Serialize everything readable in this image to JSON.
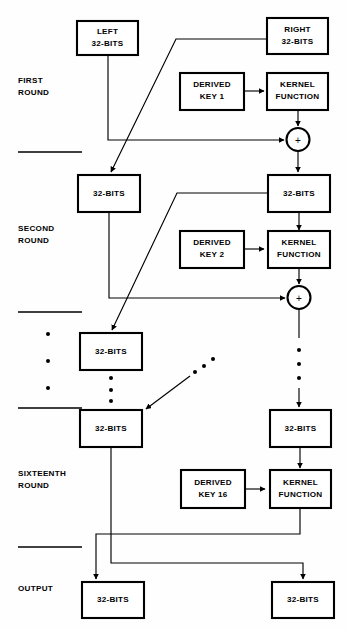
{
  "figure": {
    "colors": {
      "stroke": "#000000",
      "box_fill": "#ffffff",
      "background": "#ffffff"
    }
  },
  "round_labels": {
    "first": {
      "line1": "FIRST",
      "line2": "ROUND"
    },
    "second": {
      "line1": "SECOND",
      "line2": "ROUND"
    },
    "sixteenth": {
      "line1": "SIXTEENTH",
      "line2": "ROUND"
    },
    "output": {
      "line1": "OUTPUT"
    }
  },
  "boxes": {
    "input_left": {
      "line1": "LEFT",
      "line2": "32-BITS"
    },
    "input_right": {
      "line1": "RIGHT",
      "line2": "32-BITS"
    },
    "key1": {
      "line1": "DERIVED",
      "line2": "KEY 1"
    },
    "kernel1": {
      "line1": "KERNEL",
      "line2": "FUNCTION"
    },
    "r2_left": {
      "line1": "32-BITS"
    },
    "r2_right": {
      "line1": "32-BITS"
    },
    "key2": {
      "line1": "DERIVED",
      "line2": "KEY 2"
    },
    "kernel2": {
      "line1": "KERNEL",
      "line2": "FUNCTION"
    },
    "r3_left": {
      "line1": "32-BITS"
    },
    "r16_left": {
      "line1": "32-BITS"
    },
    "r16_right": {
      "line1": "32-BITS"
    },
    "key16": {
      "line1": "DERIVED",
      "line2": "KEY 16"
    },
    "kernel16": {
      "line1": "KERNEL",
      "line2": "FUNCTION"
    },
    "out_left": {
      "line1": "32-BITS"
    },
    "out_right": {
      "line1": "32-BITS"
    }
  },
  "operators": {
    "xor1": {
      "symbol": "+",
      "name": "xor-adder-round-1"
    },
    "xor2": {
      "symbol": "+",
      "name": "xor-adder-round-2"
    }
  },
  "ellipses": {
    "left_margin_count": 3,
    "left_column_count": 3,
    "right_column_count": 3,
    "diagonal_count": 3
  }
}
